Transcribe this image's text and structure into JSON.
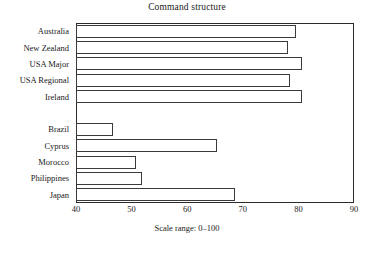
{
  "chart_data": {
    "type": "bar",
    "orientation": "horizontal",
    "title": "Command structure",
    "xlabel": "",
    "ylabel": "",
    "xlim": [
      40,
      90
    ],
    "xticks": [
      40,
      50,
      60,
      70,
      80,
      90
    ],
    "xtick_labels": [
      "40",
      "50",
      "60",
      "70",
      "80",
      "90"
    ],
    "grid": false,
    "legend": false,
    "annotation": "Scale range: 0–100",
    "categories": [
      "Australia",
      "New Zealand",
      "USA Major",
      "USA Regional",
      "Ireland",
      "",
      "Brazil",
      "Cyprus",
      "Morocco",
      "Philippines",
      "Japan"
    ],
    "values": [
      79.6,
      78.2,
      80.6,
      78.4,
      80.6,
      null,
      46.7,
      65.4,
      50.8,
      51.9,
      68.6
    ],
    "bars": [
      {
        "label": "Australia",
        "value": 79.6
      },
      {
        "label": "New Zealand",
        "value": 78.2
      },
      {
        "label": "USA Major",
        "value": 80.6
      },
      {
        "label": "USA Regional",
        "value": 78.4
      },
      {
        "label": "Ireland",
        "value": 80.6
      },
      {
        "label": "",
        "value": null
      },
      {
        "label": "Brazil",
        "value": 46.7
      },
      {
        "label": "Cyprus",
        "value": 65.4
      },
      {
        "label": "Morocco",
        "value": 50.8
      },
      {
        "label": "Philippines",
        "value": 51.9
      },
      {
        "label": "Japan",
        "value": 68.6
      }
    ],
    "bar_face_color": "#ffffff",
    "bar_edge_color": "#3a3a3a",
    "axis_color": "#2a2a2a",
    "text_color": "#1a1a1a",
    "background_color": "#ffffff"
  }
}
